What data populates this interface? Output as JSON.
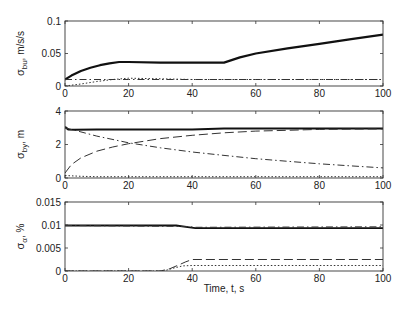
{
  "chart_data": [
    {
      "type": "line",
      "ylabel": "σ_bu, m/s/s",
      "ylabel_main": "σ",
      "ylabel_sub": "bu",
      "ylabel_rest": ", m/s/s",
      "xlabel": "",
      "xlim": [
        0,
        100
      ],
      "ylim": [
        0,
        0.1
      ],
      "xticks": [
        0,
        20,
        40,
        60,
        80,
        100
      ],
      "yticks": [
        0,
        0.05,
        0.1
      ],
      "ytick_labels": [
        "0",
        "0.05",
        "0.1"
      ],
      "grid": false,
      "series": [
        {
          "name": "solid",
          "style": "solid",
          "width": 2.2,
          "x": [
            0,
            2,
            5,
            8,
            11,
            14,
            17,
            20,
            30,
            40,
            50,
            55,
            60,
            70,
            80,
            90,
            100
          ],
          "y": [
            0.01,
            0.016,
            0.023,
            0.028,
            0.032,
            0.035,
            0.037,
            0.037,
            0.036,
            0.036,
            0.036,
            0.044,
            0.05,
            0.058,
            0.065,
            0.072,
            0.079
          ]
        },
        {
          "name": "dash-dot",
          "style": "dashdot",
          "width": 1,
          "x": [
            0,
            20,
            40,
            60,
            80,
            100
          ],
          "y": [
            0.01,
            0.01,
            0.01,
            0.01,
            0.01,
            0.01
          ]
        },
        {
          "name": "dotted",
          "style": "dotted",
          "width": 1,
          "x": [
            0,
            5,
            10,
            15,
            20,
            30,
            40,
            60,
            80,
            100
          ],
          "y": [
            0.0,
            0.003,
            0.007,
            0.01,
            0.012,
            0.011,
            0.01,
            0.01,
            0.01,
            0.01
          ]
        }
      ]
    },
    {
      "type": "line",
      "ylabel": "σ_by, m",
      "ylabel_main": "σ",
      "ylabel_sub": "by",
      "ylabel_rest": ", m",
      "xlabel": "",
      "xlim": [
        0,
        100
      ],
      "ylim": [
        0,
        4
      ],
      "xticks": [
        0,
        20,
        40,
        60,
        80,
        100
      ],
      "yticks": [
        0,
        2,
        4
      ],
      "ytick_labels": [
        "0",
        "2",
        "4"
      ],
      "grid": false,
      "series": [
        {
          "name": "solid",
          "style": "solid",
          "width": 2,
          "x": [
            0,
            1,
            3,
            10,
            40,
            50,
            100
          ],
          "y": [
            3.05,
            2.9,
            2.88,
            2.9,
            2.9,
            2.95,
            2.95
          ]
        },
        {
          "name": "dashed",
          "style": "dashed",
          "width": 1,
          "x": [
            0,
            2,
            5,
            10,
            15,
            20,
            30,
            40,
            50,
            60,
            70,
            80,
            90,
            100
          ],
          "y": [
            0.3,
            0.8,
            1.2,
            1.6,
            1.85,
            2.05,
            2.35,
            2.55,
            2.7,
            2.8,
            2.85,
            2.9,
            2.92,
            2.93
          ]
        },
        {
          "name": "dash-dot",
          "style": "dashdot",
          "width": 1,
          "x": [
            0,
            5,
            10,
            20,
            30,
            40,
            50,
            60,
            70,
            80,
            90,
            100
          ],
          "y": [
            3.0,
            2.75,
            2.5,
            2.1,
            1.8,
            1.55,
            1.35,
            1.15,
            1.0,
            0.85,
            0.72,
            0.6
          ]
        },
        {
          "name": "dotted",
          "style": "dotted",
          "width": 1,
          "x": [
            0,
            5,
            10,
            100
          ],
          "y": [
            0.15,
            0.1,
            0.08,
            0.08
          ]
        }
      ]
    },
    {
      "type": "line",
      "ylabel": "σ_α, %",
      "ylabel_main": "σ",
      "ylabel_sub": "α",
      "ylabel_rest": ", %",
      "xlabel": "Time, t, s",
      "xlim": [
        0,
        100
      ],
      "ylim": [
        0,
        0.015
      ],
      "xticks": [
        0,
        20,
        40,
        60,
        80,
        100
      ],
      "yticks": [
        0,
        0.005,
        0.01,
        0.015
      ],
      "ytick_labels": [
        "0",
        "0.005",
        "0.01",
        "0.015"
      ],
      "grid": false,
      "series": [
        {
          "name": "solid",
          "style": "solid",
          "width": 1.8,
          "x": [
            0,
            35,
            38,
            41,
            50,
            100
          ],
          "y": [
            0.0099,
            0.0099,
            0.0096,
            0.0093,
            0.0093,
            0.0093
          ]
        },
        {
          "name": "dash-dot",
          "style": "dashdot",
          "width": 1,
          "x": [
            0,
            38,
            41,
            100
          ],
          "y": [
            0.0099,
            0.0097,
            0.0095,
            0.0096
          ]
        },
        {
          "name": "dashed",
          "style": "dashed",
          "width": 1,
          "x": [
            0,
            30,
            33,
            36,
            38,
            40,
            100
          ],
          "y": [
            0.0,
            0.0,
            0.0005,
            0.0014,
            0.002,
            0.0025,
            0.0025
          ]
        },
        {
          "name": "dotted",
          "style": "dotted",
          "width": 1,
          "x": [
            0,
            31,
            34,
            37,
            40,
            100
          ],
          "y": [
            0.0,
            0.0,
            0.0006,
            0.0011,
            0.0012,
            0.0012
          ]
        }
      ]
    }
  ]
}
